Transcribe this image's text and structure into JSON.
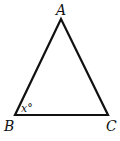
{
  "figure": {
    "type": "triangle",
    "vertices": [
      {
        "name": "A",
        "label": "A"
      },
      {
        "name": "B",
        "label": "B"
      },
      {
        "name": "C",
        "label": "C"
      }
    ],
    "angle_label": {
      "vertex": "B",
      "text": "x°"
    },
    "stroke_color": "#111111"
  }
}
